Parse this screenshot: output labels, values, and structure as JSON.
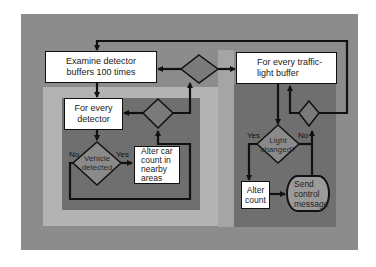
{
  "diagram": {
    "type": "flowchart",
    "title": "",
    "colors": {
      "outer_panel": "#8c8c8c",
      "light_panel": "#b3b3b3",
      "dark_panel": "#6f6f6f",
      "box_fill": "#ffffff",
      "line": "#111111"
    },
    "nodes": {
      "examine": {
        "shape": "process",
        "text": "Examine detector buffers 100 times",
        "line1": "Examine detector",
        "line2": "buffers  100 times"
      },
      "every_detector": {
        "shape": "process",
        "text": "For every detector",
        "line1": "For every",
        "line2": "detector"
      },
      "vehicle_detected": {
        "shape": "decision",
        "text": "Vehicle detected",
        "line1": "Vehicle",
        "line2": "detected"
      },
      "alter_car_count": {
        "shape": "process",
        "text": "Alter car count in nearby areas",
        "line1": "Alter car",
        "line2": "count in",
        "line3": "nearby",
        "line4": "areas"
      },
      "every_traffic_light": {
        "shape": "process",
        "text": "For every traffic-light buffer",
        "line1": "For every traffic-",
        "line2": "light buffer"
      },
      "light_changed": {
        "shape": "decision",
        "text": "Light changed?",
        "line1": "Light",
        "line2": "changed?"
      },
      "alter_count": {
        "shape": "process",
        "text": "Alter count",
        "line1": "Alter",
        "line2": "count"
      },
      "send_control": {
        "shape": "terminal",
        "text": "Send control message",
        "line1": "Send",
        "line2": "control",
        "line3": "message"
      },
      "loop_decision_top": {
        "shape": "decision",
        "text": ""
      },
      "loop_decision_detector": {
        "shape": "decision",
        "text": ""
      },
      "loop_decision_traffic": {
        "shape": "decision",
        "text": ""
      }
    },
    "edge_labels": {
      "vehicle_no": "No",
      "vehicle_yes": "Yes",
      "light_yes": "Yes",
      "light_no": "No"
    }
  }
}
